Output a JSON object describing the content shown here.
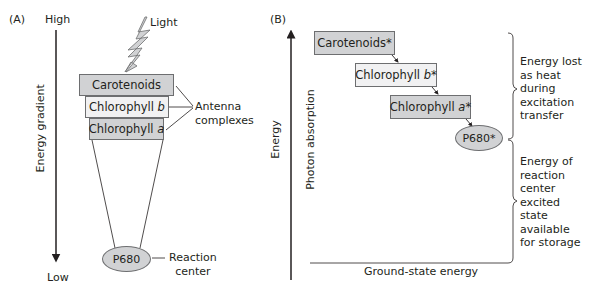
{
  "panel_a": {
    "label": "(A)",
    "axis_top": "High",
    "axis_bottom": "Low",
    "axis_title": "Energy gradient",
    "light_label": "Light",
    "boxes": [
      {
        "prefix": "Carotenoids",
        "italic": ""
      },
      {
        "prefix": "Chlorophyll ",
        "italic": "b"
      },
      {
        "prefix": "Chlorophyll ",
        "italic": "a"
      }
    ],
    "antenna_label": [
      "Antenna",
      "complexes"
    ],
    "reaction_center": "P680",
    "reaction_center_label": [
      "Reaction",
      "center"
    ]
  },
  "panel_b": {
    "label": "(B)",
    "axis_title": "Energy",
    "axis_subtitle": "Photon absorption",
    "boxes": [
      {
        "prefix": "Carotenoids*",
        "italic": "",
        "suffix": ""
      },
      {
        "prefix": "Chlorophyll ",
        "italic": "b",
        "suffix": "*"
      },
      {
        "prefix": "Chlorophyll ",
        "italic": "a",
        "suffix": "*"
      }
    ],
    "reaction_center": "P680*",
    "ground_state": "Ground-state energy",
    "brace_top_text": [
      "Energy lost",
      "as heat",
      "during",
      "excitation",
      "transfer"
    ],
    "brace_bottom_text": [
      "Energy of",
      "reaction",
      "center",
      "excited",
      "state",
      "available",
      "for storage"
    ]
  }
}
